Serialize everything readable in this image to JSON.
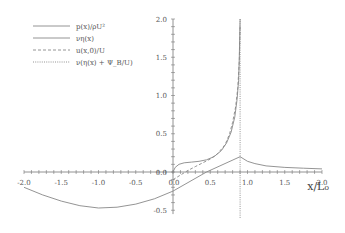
{
  "chart_data": {
    "type": "line",
    "title": "",
    "xlabel": "x/L₀",
    "ylabel": "",
    "xlim": [
      -2.0,
      2.0
    ],
    "ylim": [
      -0.5,
      2.0
    ],
    "x_ticks": [
      "-2.0",
      "-1.5",
      "-1.0",
      "-0.5",
      "0.0",
      "0.5",
      "1.0",
      "1.5",
      "2.0"
    ],
    "x_tick_values": [
      -2.0,
      -1.5,
      -1.0,
      -0.5,
      0.0,
      0.5,
      1.0,
      1.5,
      2.0
    ],
    "y_ticks": [
      "-0.5",
      "0.0",
      "0.5",
      "1.0",
      "1.5",
      "2.0"
    ],
    "y_tick_values": [
      -0.5,
      0.0,
      0.5,
      1.0,
      1.5,
      2.0
    ],
    "grid": false,
    "legend_position": "top-left",
    "singularity_x": 0.9,
    "series": [
      {
        "name": "p(x)/ρU²",
        "style": "solid",
        "color": "#888888",
        "x": [
          0.0,
          0.03,
          0.08,
          0.15,
          0.25,
          0.35,
          0.45,
          0.55,
          0.65,
          0.72,
          0.78,
          0.83,
          0.86,
          0.88,
          0.89,
          0.895,
          0.9
        ],
        "y": [
          0.0,
          0.06,
          0.1,
          0.12,
          0.13,
          0.14,
          0.16,
          0.2,
          0.28,
          0.38,
          0.52,
          0.72,
          0.95,
          1.2,
          1.5,
          1.75,
          2.0
        ]
      },
      {
        "name": "νη(x)",
        "style": "solid",
        "color": "#888888",
        "x": [
          -2.0,
          -1.75,
          -1.5,
          -1.25,
          -1.0,
          -0.75,
          -0.5,
          -0.25,
          0.0,
          0.45,
          0.9,
          1.0,
          1.1,
          1.25,
          1.5,
          1.75,
          2.0
        ],
        "y": [
          -0.2,
          -0.3,
          -0.38,
          -0.44,
          -0.47,
          -0.46,
          -0.42,
          -0.35,
          -0.25,
          0.0,
          0.2,
          0.14,
          0.11,
          0.08,
          0.06,
          0.05,
          0.04
        ]
      },
      {
        "name": "u(x,0)/U",
        "style": "dashed",
        "color": "#888888",
        "x": [
          0.0,
          0.1,
          0.2,
          0.3,
          0.4,
          0.5,
          0.6,
          0.7,
          0.76,
          0.8,
          0.84,
          0.87,
          0.89,
          0.9
        ],
        "y": [
          -0.1,
          -0.04,
          0.02,
          0.07,
          0.12,
          0.17,
          0.24,
          0.36,
          0.5,
          0.65,
          0.85,
          1.1,
          1.45,
          1.9
        ]
      },
      {
        "name": "ν(η(x) + Ψ_B/U)",
        "style": "dotted",
        "color": "#888888",
        "x": [
          0.9,
          0.9
        ],
        "y": [
          -0.6,
          2.0
        ]
      }
    ]
  },
  "legend": {
    "entries": [
      {
        "label": "p(x)/ρU²",
        "style": "solid"
      },
      {
        "label": "νη(x)",
        "style": "solid"
      },
      {
        "label": "u(x,0)/U",
        "style": "dashed"
      },
      {
        "label": "ν(η(x) + Ψ_B/U)",
        "style": "dotted"
      }
    ]
  }
}
